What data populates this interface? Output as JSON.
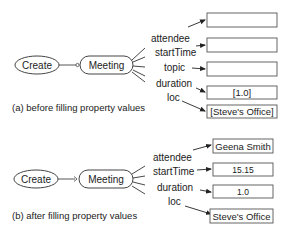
{
  "panel_a": {
    "caption": "(a) before filling property values",
    "action_node": "Create",
    "concept_node": "Meeting",
    "properties": [
      {
        "name": "attendee",
        "value": ""
      },
      {
        "name": "startTime",
        "value": ""
      },
      {
        "name": "topic",
        "value": ""
      },
      {
        "name": "duration",
        "value": "[1.0]"
      },
      {
        "name": "loc",
        "value": "[Steve's Office]"
      }
    ]
  },
  "panel_b": {
    "caption": "(b) after filling property values",
    "action_node": "Create",
    "concept_node": "Meeting",
    "properties": [
      {
        "name": "attendee",
        "value": "Geena Smith"
      },
      {
        "name": "startTime",
        "value": "15.15"
      },
      {
        "name": "duration",
        "value": "1.0"
      },
      {
        "name": "loc",
        "value": "Steve's Office"
      }
    ]
  }
}
